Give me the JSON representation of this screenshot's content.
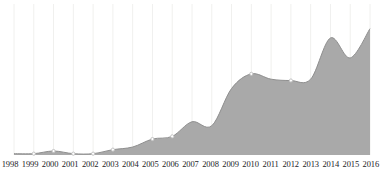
{
  "chart_data": {
    "type": "area",
    "title": "",
    "subtitle": "",
    "xlabel": "",
    "ylabel": "",
    "grid": "vertical-only",
    "legend": "none",
    "categories": [
      "1998",
      "1999",
      "2000",
      "2001",
      "2002",
      "2003",
      "2004",
      "2005",
      "2006",
      "2007",
      "2008",
      "2009",
      "2010",
      "2011",
      "2012",
      "2013",
      "2014",
      "2015",
      "2016"
    ],
    "values": [
      1,
      1,
      3,
      1,
      1,
      4,
      6,
      12,
      14,
      25,
      22,
      50,
      61,
      57,
      56,
      57,
      88,
      73,
      95
    ],
    "ylim": [
      0,
      100
    ],
    "series": [
      {
        "name": "value",
        "values": [
          1,
          1,
          3,
          1,
          1,
          4,
          6,
          12,
          14,
          25,
          22,
          50,
          61,
          57,
          56,
          57,
          88,
          73,
          95
        ]
      }
    ],
    "markers_visible_years": [
      "1999",
      "2000",
      "2001",
      "2002",
      "2003",
      "2005",
      "2006",
      "2010",
      "2012"
    ],
    "colors": {
      "area_fill": "#a9a9a9",
      "line": "#8f8f8f",
      "gridline": "#f0f0ee",
      "marker": "#bdbdbd",
      "axis_text": "#23231f",
      "background": "#ffffff"
    }
  },
  "axis": {
    "x_labels": [
      "1998",
      "1999",
      "2000",
      "2001",
      "2002",
      "2003",
      "2004",
      "2005",
      "2006",
      "2007",
      "2008",
      "2009",
      "2010",
      "2011",
      "2012",
      "2013",
      "2014",
      "2015",
      "2016"
    ]
  }
}
